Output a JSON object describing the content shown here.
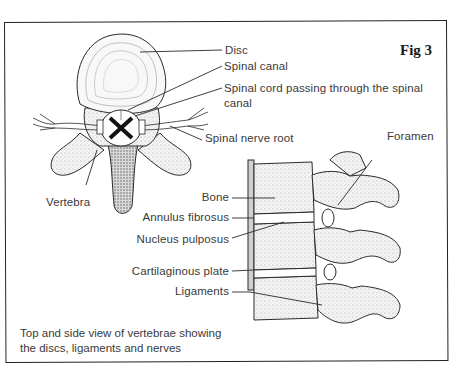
{
  "figure": {
    "label": "Fig 3",
    "caption_line1": "Top and side view of vertebrae showing",
    "caption_line2": "the discs, ligaments and nerves"
  },
  "top_view": {
    "labels": {
      "disc": "Disc",
      "spinal_canal": "Spinal canal",
      "spinal_cord_line1": "Spinal cord passing through the spinal",
      "spinal_cord_line2": "canal",
      "spinal_nerve_root": "Spinal nerve root",
      "vertebra": "Vertebra"
    }
  },
  "side_view": {
    "labels": {
      "foramen": "Foramen",
      "bone": "Bone",
      "annulus_fibrosus": "Annulus fibrosus",
      "nucleus_pulposus": "Nucleus pulposus",
      "cartilaginous_plate": "Cartilaginous plate",
      "ligaments": "Ligaments"
    }
  },
  "colors": {
    "line": "#2a2a2a",
    "text": "#3a3a3a",
    "bone_fill": "#f2f2f2",
    "shade": "#bdbdbd"
  }
}
